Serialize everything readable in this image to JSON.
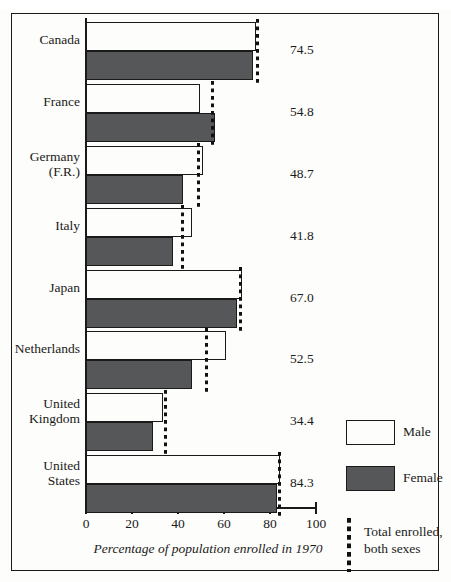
{
  "chart_data": {
    "type": "bar",
    "orientation": "horizontal",
    "title": "",
    "xlabel": "Percentage of population enrolled in 1970",
    "ylabel": "",
    "xlim": [
      0,
      100
    ],
    "xticks": [
      0,
      20,
      40,
      60,
      80,
      100
    ],
    "xtick_labels": [
      "0",
      "20",
      "40",
      "60",
      "80",
      "100"
    ],
    "grid": false,
    "legend_position": "right",
    "categories": [
      "Canada",
      "France",
      "Germany (F.R.)",
      "Italy",
      "Japan",
      "Netherlands",
      "United Kingdom",
      "United States"
    ],
    "series": [
      {
        "name": "Male",
        "color": "#fdfdfb",
        "values": [
          74.0,
          49.5,
          51.0,
          46.0,
          68.0,
          61.0,
          33.5,
          84.5
        ]
      },
      {
        "name": "Female",
        "color": "#555759",
        "values": [
          72.5,
          56.0,
          42.0,
          38.0,
          65.5,
          46.0,
          29.0,
          83.0
        ]
      },
      {
        "name": "Total enrolled, both sexes",
        "color": "#111111",
        "marker": "dashed-vertical-line",
        "values": [
          74.5,
          54.8,
          48.7,
          41.8,
          67.0,
          52.5,
          34.4,
          84.3
        ]
      }
    ],
    "value_labels": [
      "74.5",
      "54.8",
      "48.7",
      "41.8",
      "67.0",
      "52.5",
      "34.4",
      "84.3"
    ]
  },
  "rows": [
    {
      "label": "Canada",
      "male": 74.0,
      "female": 72.5,
      "total": 74.5,
      "value_text": "74.5",
      "top": 22,
      "label_top": 32,
      "label_lines": 1
    },
    {
      "label": "France",
      "male": 49.5,
      "female": 56.0,
      "total": 54.8,
      "value_text": "54.8",
      "top": 84,
      "label_top": 94,
      "label_lines": 1
    },
    {
      "label": "Germany\n(F.R.)",
      "male": 51.0,
      "female": 42.0,
      "total": 48.7,
      "value_text": "48.7",
      "top": 146,
      "label_top": 149,
      "label_lines": 2
    },
    {
      "label": "Italy",
      "male": 46.0,
      "female": 38.0,
      "total": 41.8,
      "value_text": "41.8",
      "top": 208,
      "label_top": 218,
      "label_lines": 1
    },
    {
      "label": "Japan",
      "male": 68.0,
      "female": 65.5,
      "total": 67.0,
      "value_text": "67.0",
      "top": 270,
      "label_top": 280,
      "label_lines": 1
    },
    {
      "label": "Netherlands",
      "male": 61.0,
      "female": 46.0,
      "total": 52.5,
      "value_text": "52.5",
      "top": 331,
      "label_top": 341,
      "label_lines": 1
    },
    {
      "label": "United\nKingdom",
      "male": 33.5,
      "female": 29.0,
      "total": 34.4,
      "value_text": "34.4",
      "top": 393,
      "label_top": 396,
      "label_lines": 2
    },
    {
      "label": "United\nStates",
      "male": 84.5,
      "female": 83.0,
      "total": 84.3,
      "value_text": "84.3",
      "top": 455,
      "label_top": 458,
      "label_lines": 2
    }
  ],
  "axis": {
    "ticks": [
      {
        "value": 0,
        "label": "0"
      },
      {
        "value": 20,
        "label": "20"
      },
      {
        "value": 40,
        "label": "40"
      },
      {
        "value": 60,
        "label": "60"
      },
      {
        "value": 80,
        "label": "80"
      },
      {
        "value": 100,
        "label": "100"
      }
    ]
  },
  "legend": {
    "male_label": "Male",
    "female_label": "Female",
    "total_label": "Total enrolled,\nboth sexes"
  },
  "caption": "Percentage of population enrolled in 1970"
}
